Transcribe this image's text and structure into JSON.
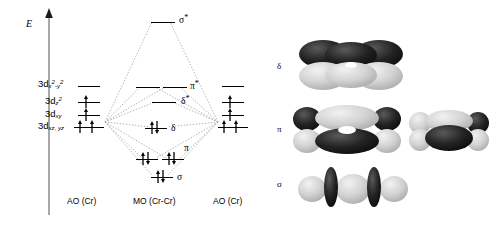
{
  "figure": {
    "type": "molecular-orbital-energy-diagram",
    "axis": {
      "energy_label": "E",
      "direction": "up"
    },
    "columns": [
      {
        "id": "ao-left",
        "caption": "AO (Cr)"
      },
      {
        "id": "mo",
        "caption": "MO (Cr-Cr)"
      },
      {
        "id": "ao-right",
        "caption": "AO (Cr)"
      }
    ],
    "ao_orbital_labels": [
      {
        "id": "dx2y2",
        "text": "3d",
        "sub": "x",
        "sup": "2",
        "sub2": "-y",
        "sup2": "2",
        "display": "3dx2-y2",
        "electrons": 0
      },
      {
        "id": "dz2",
        "text": "3d",
        "sub": "z",
        "sup": "2",
        "display": "3dz2",
        "electrons": 1
      },
      {
        "id": "dxy",
        "text": "3d",
        "sub": "xy",
        "display": "3dxy",
        "electrons": 1
      },
      {
        "id": "dxzyz",
        "text": "3d",
        "sub": "xz, yz",
        "display": "3dxz,yz",
        "electrons": 2
      }
    ],
    "mo_levels": [
      {
        "id": "sigma-star",
        "label": "σ",
        "star": "*",
        "electrons": 0,
        "count": 1
      },
      {
        "id": "pi-star",
        "label": "π",
        "star": "*",
        "electrons": 0,
        "count": 2
      },
      {
        "id": "delta-star",
        "label": "δ",
        "star": "*",
        "electrons": 0,
        "count": 1
      },
      {
        "id": "delta",
        "label": "δ",
        "star": "",
        "electrons": 2,
        "count": 1
      },
      {
        "id": "pi",
        "label": "π",
        "star": "",
        "electrons": 2,
        "count": 2
      },
      {
        "id": "sigma",
        "label": "σ",
        "star": "",
        "electrons": 2,
        "count": 1
      }
    ],
    "orbital_images": [
      {
        "id": "delta-orbital",
        "label": "δ",
        "views": 1
      },
      {
        "id": "pi-orbital",
        "label": "π",
        "views": 2
      },
      {
        "id": "sigma-orbital",
        "label": "σ",
        "views": 1
      }
    ],
    "colors": {
      "background": "#ffffff",
      "line": "#000000",
      "dotted": "#999999",
      "lobe_dark": "#171717",
      "lobe_light": "#cfcfcf"
    }
  }
}
